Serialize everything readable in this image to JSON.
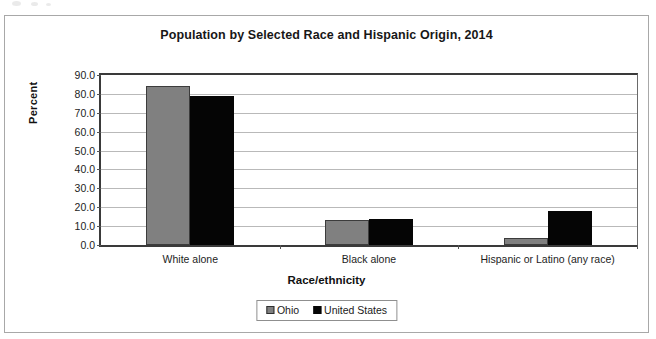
{
  "chart_data": {
    "type": "bar",
    "title": "Population by Selected Race and Hispanic Origin, 2014",
    "xlabel": "Race/ethnicity",
    "ylabel": "Percent",
    "categories": [
      "White alone",
      "Black alone",
      "Hispanic or Latino (any race)"
    ],
    "series": [
      {
        "name": "Ohio",
        "color": "#808080",
        "values": [
          84.0,
          13.0,
          3.5
        ]
      },
      {
        "name": "United States",
        "color": "#060606",
        "values": [
          79.0,
          14.0,
          18.0
        ]
      }
    ],
    "ylim": [
      0.0,
      90.0
    ],
    "ytick_step": 10.0,
    "ytick_labels": [
      "90.0",
      "80.0",
      "70.0",
      "60.0",
      "50.0",
      "40.0",
      "30.0",
      "20.0",
      "10.0",
      "0.0"
    ],
    "ytick_values": [
      90.0,
      80.0,
      70.0,
      60.0,
      50.0,
      40.0,
      30.0,
      20.0,
      10.0,
      0.0
    ],
    "grid": true,
    "legend_position": "bottom",
    "legend_entries": [
      "Ohio",
      "United States"
    ]
  }
}
